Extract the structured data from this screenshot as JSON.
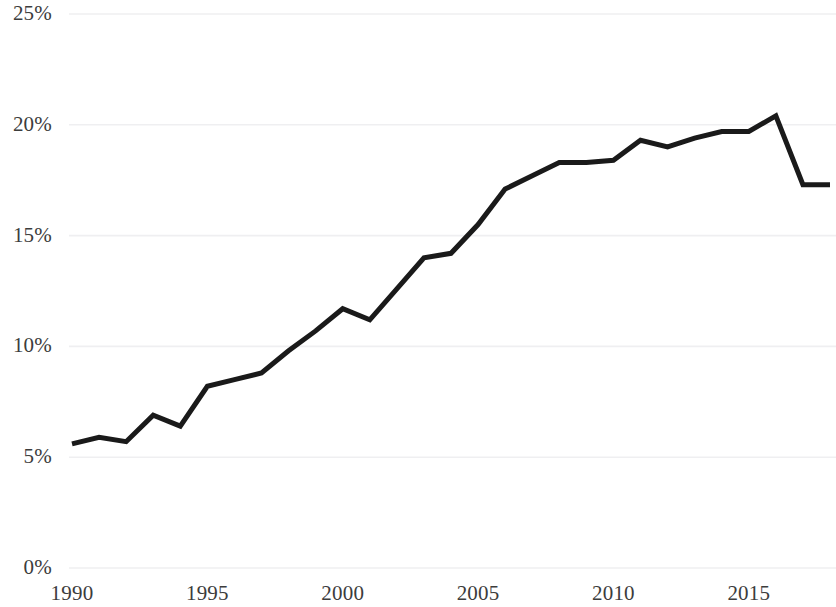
{
  "chart_data": {
    "type": "line",
    "title": "",
    "subtitle": "",
    "xlabel": "",
    "ylabel": "",
    "legend": [],
    "legend_position": "none",
    "grid": true,
    "grid_axis": "y",
    "xlim": [
      1990,
      2018
    ],
    "ylim": [
      0,
      25
    ],
    "x_tick_labels": [
      "1990",
      "1995",
      "2000",
      "2005",
      "2010",
      "2015"
    ],
    "x_ticks": [
      1990,
      1995,
      2000,
      2005,
      2010,
      2015
    ],
    "y_tick_labels": [
      "0%",
      "5%",
      "10%",
      "15%",
      "20%",
      "25%"
    ],
    "y_ticks": [
      0,
      5,
      10,
      15,
      20,
      25
    ],
    "x": [
      1990,
      1991,
      1992,
      1993,
      1994,
      1995,
      1996,
      1997,
      1998,
      1999,
      2000,
      2001,
      2002,
      2003,
      2004,
      2005,
      2006,
      2007,
      2008,
      2009,
      2010,
      2011,
      2012,
      2013,
      2014,
      2015,
      2016,
      2017,
      2018
    ],
    "values": [
      5.6,
      5.9,
      5.7,
      6.9,
      6.4,
      8.2,
      8.5,
      8.8,
      9.8,
      10.7,
      11.7,
      11.2,
      12.6,
      14.0,
      14.2,
      15.5,
      17.1,
      17.7,
      18.3,
      18.3,
      18.4,
      19.3,
      19.0,
      19.4,
      19.7,
      19.7,
      20.4,
      17.3,
      17.3
    ],
    "series": [
      {
        "name": "series-1",
        "color": "#1a1a1a",
        "line_width": 5,
        "markers": false,
        "values": [
          5.6,
          5.9,
          5.7,
          6.9,
          6.4,
          8.2,
          8.5,
          8.8,
          9.8,
          10.7,
          11.7,
          11.2,
          12.6,
          14.0,
          14.2,
          15.5,
          17.1,
          17.7,
          18.3,
          18.3,
          18.4,
          19.3,
          19.0,
          19.4,
          19.7,
          19.7,
          20.4,
          17.3,
          17.3
        ]
      }
    ],
    "colors": {
      "line": "#1a1a1a",
      "grid": "#efeff1",
      "tick_label": "#3c3c3c",
      "background": "#ffffff"
    }
  },
  "plot_geometry": {
    "left": 72,
    "right": 830,
    "top": 14,
    "bottom": 568
  }
}
